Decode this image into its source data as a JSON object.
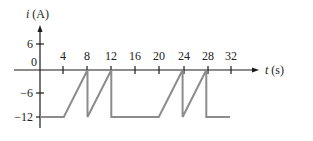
{
  "chart_data": {
    "type": "line",
    "title": "",
    "xlabel": "t (s)",
    "ylabel": "i (A)",
    "ylabel_var": "i",
    "ylabel_unit": "(A)",
    "xlabel_var": "t",
    "xlabel_unit": "(s)",
    "x_ticks": [
      "4",
      "8",
      "12",
      "16",
      "20",
      "24",
      "28",
      "32"
    ],
    "y_ticks": [
      "6",
      "0",
      "−6",
      "−12"
    ],
    "xlim": [
      0,
      32
    ],
    "ylim": [
      -12,
      6
    ],
    "grid": false,
    "legend": null,
    "series": [
      {
        "name": "i(t)",
        "color": "#8c8c8c",
        "x": [
          0,
          4,
          8,
          8,
          12,
          12,
          20,
          24,
          24,
          28,
          28,
          32
        ],
        "y": [
          -12,
          -12,
          0,
          -12,
          0,
          -12,
          -12,
          0,
          -12,
          0,
          -12,
          -12
        ]
      }
    ]
  }
}
